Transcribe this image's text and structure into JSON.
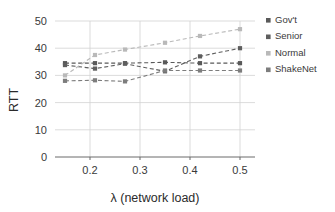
{
  "chart_data": {
    "type": "line",
    "title": "",
    "xlabel": "λ (network load)",
    "ylabel": "RTT",
    "x": [
      0.15,
      0.21,
      0.27,
      0.35,
      0.42,
      0.5
    ],
    "xlim": [
      0.13,
      0.53
    ],
    "ylim": [
      0,
      50
    ],
    "xticks": [
      0.2,
      0.3,
      0.4,
      0.5
    ],
    "xtick_labels": [
      "0.2",
      "0.3",
      "0.4",
      "0.5"
    ],
    "yticks": [
      0,
      10,
      20,
      30,
      40,
      50
    ],
    "ytick_labels": [
      "0",
      "10",
      "20",
      "30",
      "40",
      "50"
    ],
    "grid": true,
    "grid_axis": "both",
    "legend_position": "right",
    "marker": "square",
    "linestyle": "dashed",
    "series": [
      {
        "name": "Gov't",
        "color": "#595959",
        "values": [
          34.5,
          34.5,
          34.5,
          34.8,
          34.5,
          34.5
        ]
      },
      {
        "name": "Senior",
        "color": "#5e5e5e",
        "values": [
          33.8,
          32.5,
          34.3,
          31.5,
          37.0,
          40.0
        ]
      },
      {
        "name": "Normal",
        "color": "#b9b9b9",
        "values": [
          30.0,
          37.5,
          39.5,
          42.0,
          44.5,
          47.0
        ]
      },
      {
        "name": "ShakeNet",
        "color": "#7d7d7d",
        "values": [
          28.0,
          28.2,
          27.8,
          31.8,
          31.8,
          31.8
        ]
      }
    ]
  },
  "axes": {
    "ylabel": "RTT",
    "xlabel": "λ (network load)"
  },
  "legend": {
    "items": [
      {
        "label": "Gov't",
        "color": "#595959"
      },
      {
        "label": "Senior",
        "color": "#5e5e5e"
      },
      {
        "label": "Normal",
        "color": "#b9b9b9"
      },
      {
        "label": "ShakeNet",
        "color": "#7d7d7d"
      }
    ]
  }
}
